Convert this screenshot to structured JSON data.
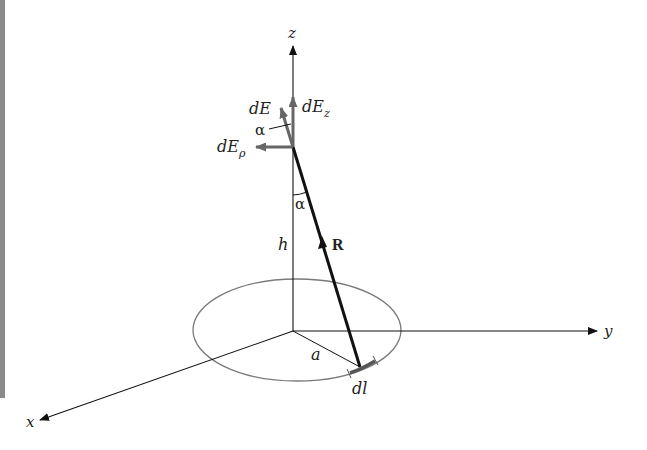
{
  "diagram": {
    "type": "physics-vector-diagram",
    "axes": {
      "x": {
        "label": "x"
      },
      "y": {
        "label": "y"
      },
      "z": {
        "label": "z"
      }
    },
    "labels": {
      "dE": "dE",
      "dEz_main": "dE",
      "dEz_sub": "z",
      "dErho_main": "dE",
      "dErho_sub": "ρ",
      "alpha_top": "α",
      "alpha_bottom": "α",
      "height": "h",
      "R": "R",
      "radius": "a",
      "dl": "dl"
    },
    "colors": {
      "axis": "#111111",
      "ring": "#7a7a7a",
      "vector": "#666666",
      "R_line": "#111111",
      "left_bar": "#8a8a8a"
    }
  }
}
